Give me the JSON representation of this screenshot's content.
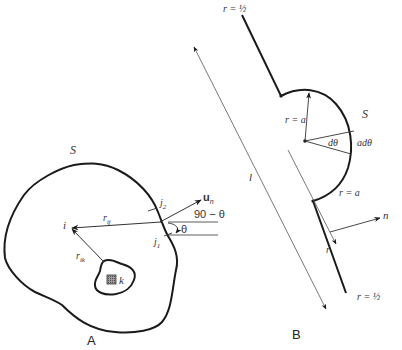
{
  "figure_a": {
    "panel_label": "A",
    "surface_label": "S",
    "point_i": "i",
    "point_k": "k",
    "vec_rij": "r",
    "vec_rij_sub": "ij",
    "vec_rik": "r",
    "vec_rik_sub": "ik",
    "point_j1": "j",
    "point_j1_sub": "1",
    "point_j2": "j",
    "point_j2_sub": "2",
    "normal_label": "u",
    "normal_sub": "n",
    "angle_comp": "90 − θ",
    "angle_theta": "θ"
  },
  "figure_b": {
    "panel_label": "B",
    "surface_label": "S",
    "top_end_label": "r = ½",
    "bottom_end_label": "r = ½",
    "radius_label_1": "r = a",
    "radius_label_2": "r = a",
    "dtheta_label": "dθ",
    "arc_label": "adθ",
    "length_label": "l",
    "r_arrow_label": "r",
    "normal_label": "n"
  },
  "colors": {
    "line": "#1a1a1a",
    "thin_line": "#555555",
    "text": "#333333",
    "hatch": "#666666"
  }
}
